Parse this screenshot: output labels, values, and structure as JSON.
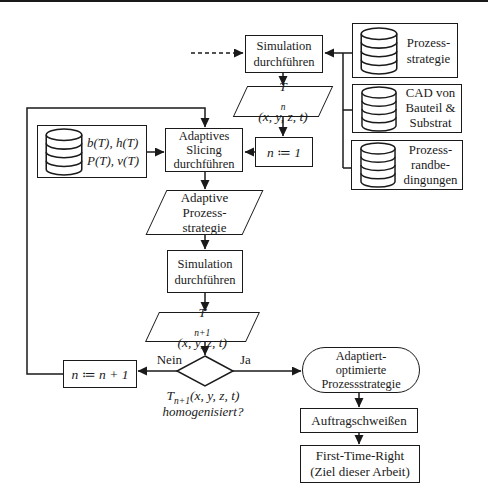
{
  "colors": {
    "line": "#1a1a1a",
    "background": "#ffffff"
  },
  "nodes": {
    "simulation_top": {
      "line1": "Simulation",
      "line2": "durchführen"
    },
    "db_strategy": {
      "line1": "Prozess-",
      "line2": "strategie"
    },
    "db_cad": {
      "line1": "CAD von",
      "line2": "Bauteil &",
      "line3": "Substrat"
    },
    "db_constraints": {
      "line1": "Prozess-",
      "line2": "randbe-",
      "line3": "dingungen"
    },
    "db_parameters": {
      "line1": "b(T), h(T)",
      "line2": "P(T), v(T)"
    },
    "t_n": {
      "base": "T",
      "sub": "n",
      "args": "(x, y, z, t)"
    },
    "n_init": {
      "label": "n ≔ 1"
    },
    "adaptive_slicing": {
      "line1": "Adaptives",
      "line2": "Slicing",
      "line3": "durchführen"
    },
    "adaptive_strategy": {
      "line1": "Adaptive",
      "line2": "Prozess-",
      "line3": "strategie"
    },
    "simulation_loop": {
      "line1": "Simulation",
      "line2": "durchführen"
    },
    "t_n1": {
      "base": "T",
      "sub": "n+1",
      "args": "(x, y, z, t)"
    },
    "decision": {
      "no": "Nein",
      "yes": "Ja"
    },
    "decision_caption": {
      "base": "T",
      "sub": "n+1",
      "args": "(x, y, z, t)",
      "line2": "homogenisiert?"
    },
    "n_increment": {
      "label": "n ≔ n + 1"
    },
    "adapted_strategy": {
      "line1": "Adaptiert-",
      "line2": "optimierte",
      "line3": "Prozessstrategie"
    },
    "welding": {
      "label": "Auftragschweißen"
    },
    "first_time_right": {
      "line1": "First-Time-Right",
      "line2": "(Ziel dieser Arbeit)"
    }
  }
}
